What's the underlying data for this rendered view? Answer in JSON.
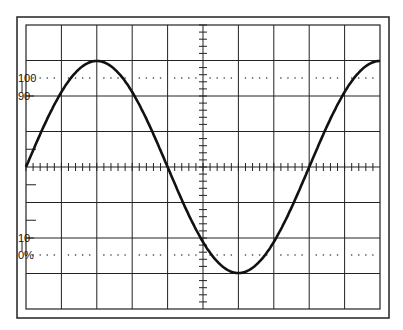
{
  "diagram": {
    "type": "oscilloscope-graticule",
    "grid": {
      "columns": 10,
      "rows": 8,
      "minor_ticks_per_division": 5
    },
    "labels": {
      "l100": "100",
      "l90": "90",
      "l10": "10",
      "l0": "0%"
    },
    "waveform": {
      "shape": "sine",
      "cycles": 1.25,
      "start_phase": "zero-rising"
    },
    "colors": {
      "line": "#111111",
      "grid": "#222222",
      "background": "#ffffff"
    }
  }
}
